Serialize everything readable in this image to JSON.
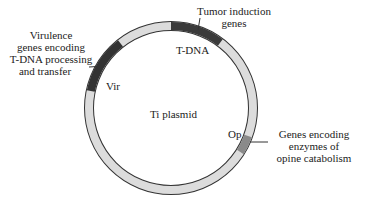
{
  "diagram": {
    "title": "Ti plasmid",
    "colors": {
      "ring_fill": "#dcdcdc",
      "ring_stroke": "#333333",
      "tdna": "#3a3a3a",
      "vir": "#333333",
      "op": "#8a8a8a",
      "background": "#ffffff"
    },
    "segments": [
      {
        "id": "tdna",
        "label": "T-DNA",
        "annotation": [
          "Tumor induction",
          "genes"
        ]
      },
      {
        "id": "vir",
        "label": "Vir",
        "annotation": [
          "Virulence",
          "genes encoding",
          "T-DNA processing",
          "and transfer"
        ]
      },
      {
        "id": "op",
        "label": "Op",
        "annotation": [
          "Genes encoding",
          "enzymes of",
          "opine catabolism"
        ]
      }
    ]
  }
}
